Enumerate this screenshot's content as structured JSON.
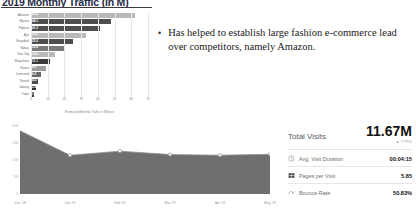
{
  "slide": {
    "title": "2019 Monthly Traffic (in M)"
  },
  "bullets": [
    {
      "marker": "•",
      "text": "Has helped to establish large fashion e-commerce lead over competitors, namely Amazon."
    }
  ],
  "chart_data": [
    {
      "type": "bar",
      "title": "2019 Monthly Traffic (in M)",
      "orientation": "horizontal",
      "xlabel": "Estimated Monthly Traffic in Millions",
      "ylabel": "",
      "xlim": [
        0,
        70
      ],
      "xticks": [
        0,
        10,
        20,
        30,
        40,
        50,
        60,
        70
      ],
      "grid": true,
      "categories": [
        "Amazon",
        "Myntra",
        "Flipkart",
        "Ajio",
        "Snapdeal",
        "Nykaa",
        "Tata Cliq",
        "Shopclues",
        "Koovs",
        "Limeroad",
        "Voonik",
        "Jabong",
        "Tadai"
      ],
      "values": [
        62.4,
        48.1,
        41.3,
        33.0,
        25.2,
        20.4,
        14.6,
        11.1,
        8.8,
        6.2,
        4.4,
        2.9,
        1.5
      ],
      "value_labels": [
        "62.4",
        "48.1",
        "41.3",
        "33.0",
        "25.2",
        "20.4",
        "14.6",
        "11.1",
        "8.8",
        "6.2",
        "4.4",
        "2.9",
        "1.5"
      ],
      "bar_colors": [
        "#b9b9b9",
        "#4e4e4e",
        "#4e4e4e",
        "#b9b9b9",
        "#4e4e4e",
        "#7a7a7a",
        "#b9b9b9",
        "#3a3a3a",
        "#9d9d9d",
        "#6b6b6b",
        "#4e4e4e",
        "#2f2f2f",
        "#3a3a3a"
      ]
    },
    {
      "type": "area",
      "title": "",
      "xlabel": "",
      "ylabel": "",
      "x": [
        "Dec 18",
        "Jan 19",
        "Feb 19",
        "Mar 19",
        "Apr 19",
        "May 19"
      ],
      "values": [
        18.6,
        11.4,
        12.6,
        11.6,
        11.4,
        11.67
      ],
      "ylim": [
        0,
        20
      ],
      "yticks": [
        "20M",
        "15M",
        "10M",
        "5M",
        "0"
      ],
      "grid": false,
      "series_color": "#6f6f6f",
      "marker_color": "#ffffff",
      "legend": "none"
    }
  ],
  "metrics": {
    "headline_label": "Total Visits",
    "headline_value": "11.67M",
    "headline_delta": "▲ 7.79%",
    "rows": [
      {
        "icon": "clock-icon",
        "name": "Avg. Visit Duration",
        "value": "00:04:15"
      },
      {
        "icon": "pages-icon",
        "name": "Pages per Visit",
        "value": "5.85"
      },
      {
        "icon": "bounce-icon",
        "name": "Bounce Rate",
        "value": "50.83%"
      }
    ]
  }
}
